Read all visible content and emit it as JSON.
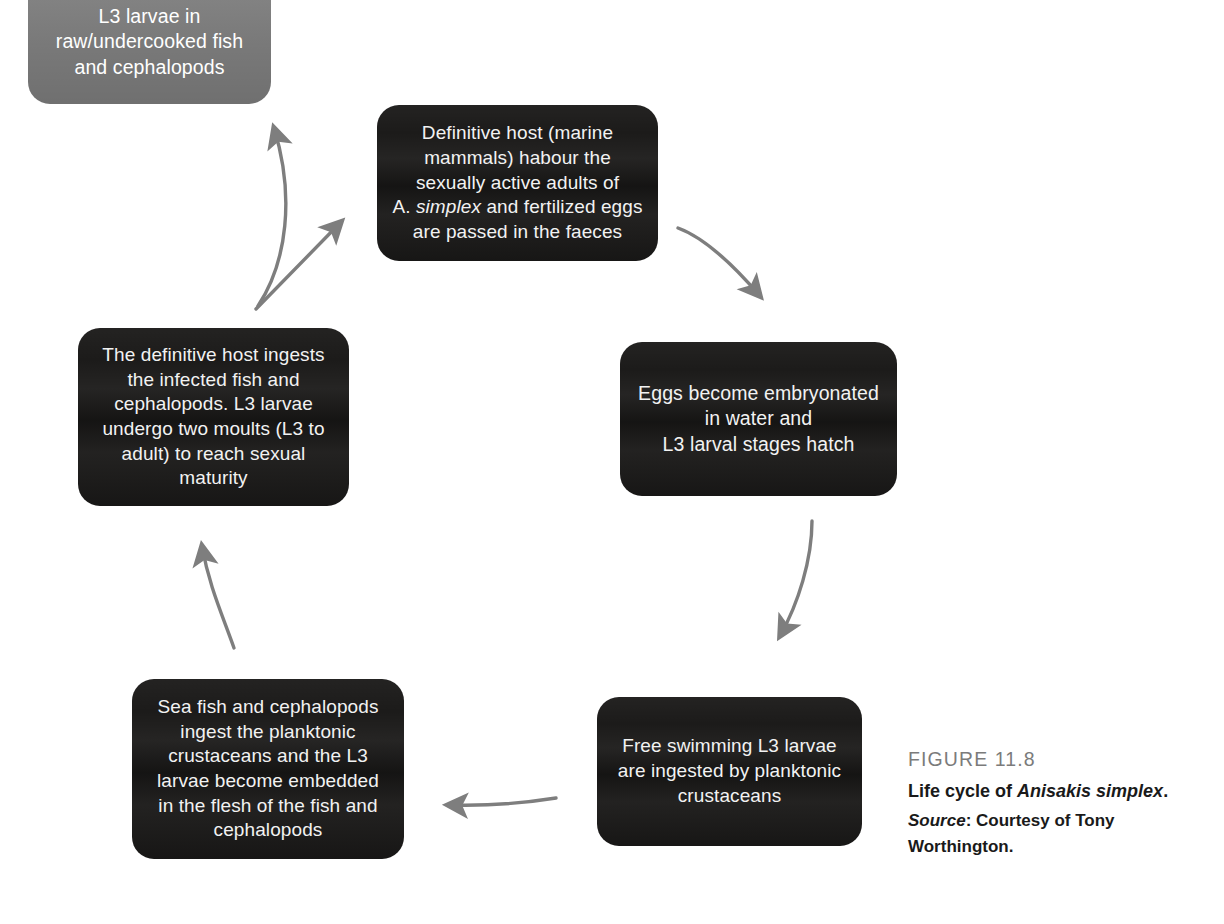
{
  "figure": {
    "label": "FIGURE 11.8",
    "title_prefix": "Life cycle of ",
    "title_italic": "Anisakis simplex",
    "title_suffix": ".",
    "source_word": "Source",
    "source_text": ": Courtesy of Tony Worthington."
  },
  "colors": {
    "node_dark": "#1c1b1a",
    "node_grey": "#7f7f7f",
    "arrow": "#7e7e7e",
    "text_light": "#f2f2f2",
    "caption_label": "#7b7b7b",
    "background": "#ffffff"
  },
  "nodes": [
    {
      "id": "raw-fish",
      "style": "grey",
      "lines": [
        "L3 larvae in",
        "raw/undercooked fish",
        "and cephalopods"
      ],
      "text": "L3 larvae in raw/undercooked fish and cephalopods"
    },
    {
      "id": "definitive-host",
      "style": "dark",
      "lines": [
        "Definitive host (marine",
        "mammals) habour the",
        "sexually active adults of",
        "A. simplex and fertilized eggs",
        "are passed in the faeces"
      ],
      "text_before_italic": "Definitive host (marine mammals) habour the sexually active adults of A. ",
      "text_italic": "simplex",
      "text_after_italic": " and fertilized eggs are passed in the faeces"
    },
    {
      "id": "eggs",
      "style": "dark",
      "lines": [
        "Eggs become embryonated",
        "in water and",
        "L3 larval stages hatch"
      ],
      "text": "Eggs become embryonated in water and L3 larval stages hatch"
    },
    {
      "id": "free-swimming",
      "style": "dark",
      "lines": [
        "Free swimming L3 larvae",
        "are ingested by planktonic",
        "crustaceans"
      ],
      "text": "Free swimming L3 larvae are ingested by planktonic crustaceans"
    },
    {
      "id": "sea-fish",
      "style": "dark",
      "lines": [
        "Sea fish and cephalopods",
        "ingest the planktonic",
        "crustaceans and the L3",
        "larvae become embedded",
        "in the flesh of the fish and",
        "cephalopods"
      ],
      "text": "Sea fish and cephalopods ingest the planktonic crustaceans and the L3 larvae become embedded in the flesh of the fish and cephalopods"
    },
    {
      "id": "host-ingests",
      "style": "dark",
      "lines": [
        "The definitive host ingests",
        "the infected fish and",
        "cephalopods. L3 larvae",
        "undergo two moults (L3 to",
        "adult) to reach sexual",
        "maturity"
      ],
      "text": "The definitive host ingests the infected fish and cephalopods. L3 larvae undergo two moults (L3 to adult) to reach sexual maturity"
    }
  ],
  "arrows": [
    {
      "id": "arrow-host-to-eggs",
      "from": "definitive-host",
      "to": "eggs",
      "direction": "down-right"
    },
    {
      "id": "arrow-eggs-to-free-swimming",
      "from": "eggs",
      "to": "free-swimming",
      "direction": "down-left"
    },
    {
      "id": "arrow-free-swimming-to-sea-fish",
      "from": "free-swimming",
      "to": "sea-fish",
      "direction": "left"
    },
    {
      "id": "arrow-sea-fish-to-host-ingests",
      "from": "sea-fish",
      "to": "host-ingests",
      "direction": "up"
    },
    {
      "id": "arrow-host-ingests-to-raw-fish",
      "from": "host-ingests",
      "to": "raw-fish",
      "direction": "up"
    },
    {
      "id": "arrow-host-ingests-to-definitive-host",
      "from": "host-ingests",
      "to": "definitive-host",
      "direction": "up-right"
    }
  ]
}
